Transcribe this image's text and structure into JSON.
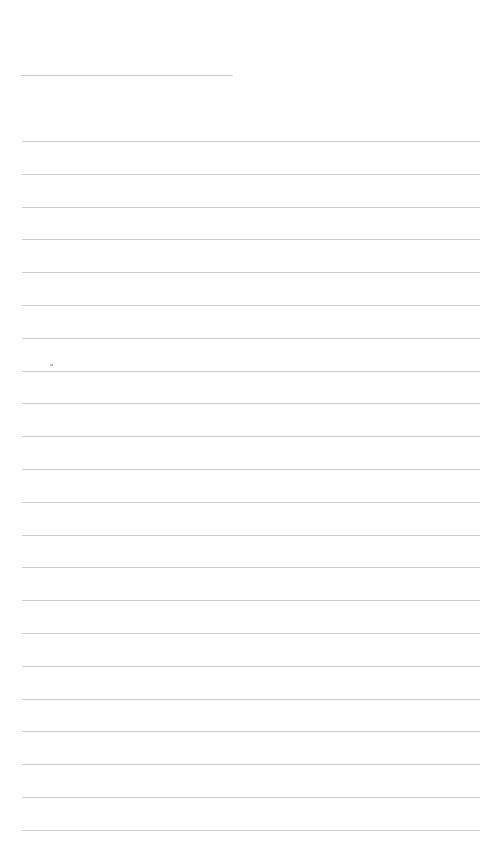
{
  "document": {
    "type": "lined-paper",
    "title_line": {
      "x": 21,
      "y": 75,
      "width": 212
    },
    "rules": {
      "count": 22,
      "x": 22,
      "first_y": 141,
      "spacing": 32.8,
      "width": 458
    },
    "colors": {
      "background": "#ffffff",
      "rule": "#cdcdcd"
    }
  }
}
